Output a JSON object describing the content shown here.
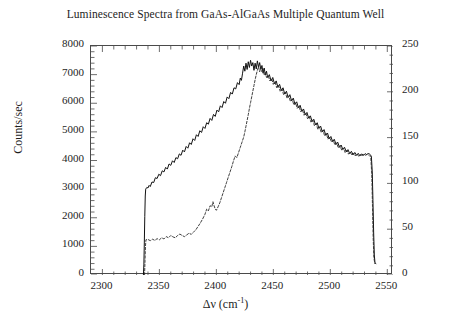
{
  "chart_data": {
    "type": "line",
    "title": "Luminescence Spectra from GaAs-AlGaAs Multiple Quantum Well",
    "xlabel_text": "Δν (cm",
    "xlabel_sup": "-1",
    "xlabel_tail": ")",
    "ylabel": "Counts/sec",
    "ylabel_right": "",
    "xlim": [
      2290,
      2555
    ],
    "ylim": [
      0,
      8000
    ],
    "ylim_right": [
      0,
      250
    ],
    "xticks": [
      2300,
      2350,
      2400,
      2450,
      2500,
      2550
    ],
    "yticks": [
      0,
      1000,
      2000,
      3000,
      4000,
      5000,
      6000,
      7000,
      8000
    ],
    "yticks_right": [
      0,
      50,
      100,
      150,
      200,
      250
    ],
    "x_minor_step": 10,
    "y_minor_step": 200,
    "y_right_minor_step": 10,
    "grid": false,
    "legend": "none",
    "series": [
      {
        "name": "solid-spectrum",
        "style": "solid",
        "color": "#111111",
        "points": [
          [
            2336.0,
            0
          ],
          [
            2336.4,
            380
          ],
          [
            2336.8,
            1150
          ],
          [
            2337.2,
            2050
          ],
          [
            2337.6,
            2760
          ],
          [
            2338.0,
            3000
          ],
          [
            2339.0,
            3060
          ],
          [
            2340.0,
            3040
          ],
          [
            2341.0,
            3130
          ],
          [
            2342.0,
            3090
          ],
          [
            2343.5,
            3250
          ],
          [
            2345.0,
            3230
          ],
          [
            2346.5,
            3400
          ],
          [
            2348.0,
            3370
          ],
          [
            2349.5,
            3520
          ],
          [
            2351.0,
            3470
          ],
          [
            2352.5,
            3640
          ],
          [
            2354.0,
            3600
          ],
          [
            2355.5,
            3760
          ],
          [
            2357.0,
            3700
          ],
          [
            2358.5,
            3880
          ],
          [
            2360.0,
            3830
          ],
          [
            2361.5,
            3990
          ],
          [
            2363.0,
            3930
          ],
          [
            2364.5,
            4100
          ],
          [
            2366.0,
            4060
          ],
          [
            2367.5,
            4230
          ],
          [
            2369.0,
            4180
          ],
          [
            2370.5,
            4360
          ],
          [
            2372.0,
            4300
          ],
          [
            2373.5,
            4490
          ],
          [
            2375.0,
            4430
          ],
          [
            2376.5,
            4620
          ],
          [
            2378.0,
            4560
          ],
          [
            2379.5,
            4760
          ],
          [
            2381.0,
            4700
          ],
          [
            2382.5,
            4900
          ],
          [
            2384.0,
            4840
          ],
          [
            2385.5,
            5040
          ],
          [
            2387.0,
            4980
          ],
          [
            2388.5,
            5180
          ],
          [
            2390.0,
            5120
          ],
          [
            2391.5,
            5320
          ],
          [
            2393.0,
            5270
          ],
          [
            2394.5,
            5470
          ],
          [
            2396.0,
            5400
          ],
          [
            2397.5,
            5610
          ],
          [
            2399.0,
            5540
          ],
          [
            2400.5,
            5760
          ],
          [
            2402.0,
            5700
          ],
          [
            2403.5,
            5910
          ],
          [
            2405.0,
            5850
          ],
          [
            2406.5,
            6060
          ],
          [
            2408.0,
            6000
          ],
          [
            2409.5,
            6220
          ],
          [
            2411.0,
            6160
          ],
          [
            2412.5,
            6380
          ],
          [
            2414.0,
            6320
          ],
          [
            2415.5,
            6540
          ],
          [
            2417.0,
            6500
          ],
          [
            2418.5,
            6720
          ],
          [
            2420.0,
            6650
          ],
          [
            2421.0,
            6880
          ],
          [
            2422.0,
            6800
          ],
          [
            2423.0,
            7050
          ],
          [
            2424.0,
            7300
          ],
          [
            2425.0,
            7120
          ],
          [
            2426.0,
            7400
          ],
          [
            2427.0,
            7180
          ],
          [
            2428.0,
            7450
          ],
          [
            2429.0,
            7250
          ],
          [
            2430.0,
            7500
          ],
          [
            2431.0,
            7300
          ],
          [
            2432.0,
            7420
          ],
          [
            2433.0,
            7150
          ],
          [
            2434.0,
            7400
          ],
          [
            2435.0,
            7200
          ],
          [
            2436.0,
            7480
          ],
          [
            2437.0,
            7260
          ],
          [
            2438.0,
            7420
          ],
          [
            2439.0,
            7180
          ],
          [
            2440.0,
            7320
          ],
          [
            2441.0,
            7050
          ],
          [
            2442.0,
            7230
          ],
          [
            2443.0,
            6980
          ],
          [
            2444.0,
            7120
          ],
          [
            2445.0,
            6900
          ],
          [
            2446.5,
            7000
          ],
          [
            2448.0,
            6780
          ],
          [
            2449.5,
            6900
          ],
          [
            2451.0,
            6680
          ],
          [
            2452.5,
            6780
          ],
          [
            2454.0,
            6560
          ],
          [
            2455.5,
            6660
          ],
          [
            2457.0,
            6440
          ],
          [
            2458.5,
            6540
          ],
          [
            2460.0,
            6320
          ],
          [
            2461.5,
            6420
          ],
          [
            2463.0,
            6200
          ],
          [
            2464.5,
            6300
          ],
          [
            2466.0,
            6080
          ],
          [
            2467.5,
            6180
          ],
          [
            2469.0,
            5960
          ],
          [
            2470.5,
            6050
          ],
          [
            2472.0,
            5840
          ],
          [
            2473.5,
            5930
          ],
          [
            2475.0,
            5720
          ],
          [
            2476.5,
            5800
          ],
          [
            2478.0,
            5600
          ],
          [
            2479.5,
            5680
          ],
          [
            2481.0,
            5480
          ],
          [
            2482.5,
            5560
          ],
          [
            2484.0,
            5360
          ],
          [
            2485.5,
            5440
          ],
          [
            2487.0,
            5240
          ],
          [
            2488.5,
            5320
          ],
          [
            2490.0,
            5120
          ],
          [
            2491.5,
            5200
          ],
          [
            2493.0,
            5000
          ],
          [
            2494.5,
            5080
          ],
          [
            2496.0,
            4880
          ],
          [
            2497.5,
            4960
          ],
          [
            2499.0,
            4760
          ],
          [
            2500.5,
            4840
          ],
          [
            2502.0,
            4660
          ],
          [
            2503.5,
            4740
          ],
          [
            2505.0,
            4560
          ],
          [
            2506.5,
            4640
          ],
          [
            2508.0,
            4460
          ],
          [
            2509.5,
            4540
          ],
          [
            2511.0,
            4380
          ],
          [
            2512.5,
            4460
          ],
          [
            2514.0,
            4300
          ],
          [
            2515.5,
            4380
          ],
          [
            2517.0,
            4240
          ],
          [
            2518.5,
            4320
          ],
          [
            2520.0,
            4200
          ],
          [
            2521.5,
            4280
          ],
          [
            2523.0,
            4180
          ],
          [
            2524.5,
            4250
          ],
          [
            2526.0,
            4160
          ],
          [
            2527.5,
            4230
          ],
          [
            2529.0,
            4180
          ],
          [
            2530.5,
            4240
          ],
          [
            2532.0,
            4200
          ],
          [
            2533.5,
            4260
          ],
          [
            2535.0,
            4200
          ],
          [
            2536.0,
            4150
          ],
          [
            2536.8,
            3600
          ],
          [
            2537.4,
            2600
          ],
          [
            2538.0,
            1500
          ],
          [
            2538.6,
            700
          ],
          [
            2539.2,
            420
          ],
          [
            2540.0,
            400
          ]
        ]
      },
      {
        "name": "dashed-spectrum",
        "style": "dashed",
        "color": "#2a2a2a",
        "points": [
          [
            2337.0,
            0
          ],
          [
            2337.4,
            500
          ],
          [
            2337.8,
            1000
          ],
          [
            2338.2,
            1230
          ],
          [
            2340.0,
            1240
          ],
          [
            2342.0,
            1200
          ],
          [
            2344.0,
            1250
          ],
          [
            2346.0,
            1210
          ],
          [
            2348.0,
            1270
          ],
          [
            2350.0,
            1230
          ],
          [
            2352.0,
            1300
          ],
          [
            2354.0,
            1260
          ],
          [
            2356.0,
            1340
          ],
          [
            2358.0,
            1300
          ],
          [
            2360.0,
            1380
          ],
          [
            2362.0,
            1330
          ],
          [
            2364.0,
            1300
          ],
          [
            2366.0,
            1380
          ],
          [
            2368.0,
            1430
          ],
          [
            2370.0,
            1380
          ],
          [
            2372.0,
            1340
          ],
          [
            2374.0,
            1400
          ],
          [
            2376.0,
            1460
          ],
          [
            2378.0,
            1420
          ],
          [
            2380.0,
            1500
          ],
          [
            2382.0,
            1580
          ],
          [
            2384.0,
            1700
          ],
          [
            2386.0,
            1820
          ],
          [
            2388.0,
            1960
          ],
          [
            2390.0,
            2120
          ],
          [
            2391.5,
            2300
          ],
          [
            2393.0,
            2240
          ],
          [
            2394.5,
            2420
          ],
          [
            2396.0,
            2380
          ],
          [
            2397.0,
            2560
          ],
          [
            2398.0,
            2420
          ],
          [
            2399.0,
            2300
          ],
          [
            2400.0,
            2260
          ],
          [
            2401.5,
            2380
          ],
          [
            2403.0,
            2520
          ],
          [
            2404.5,
            2700
          ],
          [
            2406.0,
            2880
          ],
          [
            2407.5,
            3060
          ],
          [
            2409.0,
            3240
          ],
          [
            2410.5,
            3420
          ],
          [
            2412.0,
            3600
          ],
          [
            2413.5,
            3780
          ],
          [
            2415.0,
            3980
          ],
          [
            2416.5,
            4160
          ],
          [
            2418.0,
            4100
          ],
          [
            2419.5,
            4280
          ],
          [
            2421.0,
            4460
          ],
          [
            2422.5,
            4640
          ],
          [
            2424.0,
            4820
          ],
          [
            2425.0,
            5000
          ],
          [
            2426.0,
            5200
          ],
          [
            2427.0,
            5400
          ],
          [
            2428.0,
            5600
          ],
          [
            2429.0,
            5820
          ],
          [
            2430.0,
            6020
          ],
          [
            2431.0,
            6220
          ],
          [
            2432.0,
            6420
          ],
          [
            2433.0,
            6620
          ],
          [
            2434.0,
            6820
          ],
          [
            2435.0,
            7000
          ],
          [
            2436.0,
            7150
          ],
          [
            2437.0,
            7280
          ],
          [
            2438.0,
            7100
          ],
          [
            2439.0,
            7250
          ],
          [
            2440.0,
            7100
          ],
          [
            2441.0,
            7200
          ],
          [
            2442.0,
            7000
          ],
          [
            2443.0,
            7080
          ],
          [
            2444.0,
            6900
          ],
          [
            2445.5,
            6960
          ],
          [
            2447.0,
            6780
          ],
          [
            2448.5,
            6860
          ],
          [
            2450.0,
            6660
          ],
          [
            2451.5,
            6740
          ],
          [
            2453.0,
            6540
          ],
          [
            2454.5,
            6620
          ],
          [
            2456.0,
            6420
          ],
          [
            2457.5,
            6500
          ],
          [
            2459.0,
            6300
          ],
          [
            2460.5,
            6380
          ],
          [
            2462.0,
            6180
          ],
          [
            2463.5,
            6260
          ],
          [
            2465.0,
            6060
          ],
          [
            2466.5,
            6140
          ],
          [
            2468.0,
            5940
          ],
          [
            2469.5,
            6020
          ],
          [
            2471.0,
            5820
          ],
          [
            2472.5,
            5900
          ],
          [
            2474.0,
            5700
          ],
          [
            2475.5,
            5780
          ],
          [
            2477.0,
            5580
          ],
          [
            2478.5,
            5660
          ],
          [
            2480.0,
            5460
          ],
          [
            2481.5,
            5540
          ],
          [
            2483.0,
            5340
          ],
          [
            2484.5,
            5420
          ],
          [
            2486.0,
            5220
          ],
          [
            2487.5,
            5300
          ],
          [
            2489.0,
            5100
          ],
          [
            2490.5,
            5180
          ],
          [
            2492.0,
            4980
          ],
          [
            2493.5,
            5060
          ],
          [
            2495.0,
            4860
          ],
          [
            2496.5,
            4940
          ],
          [
            2498.0,
            4740
          ],
          [
            2499.5,
            4820
          ],
          [
            2501.0,
            4640
          ],
          [
            2502.5,
            4720
          ],
          [
            2504.0,
            4540
          ],
          [
            2505.5,
            4620
          ],
          [
            2507.0,
            4440
          ],
          [
            2508.5,
            4520
          ],
          [
            2510.0,
            4360
          ],
          [
            2511.5,
            4440
          ],
          [
            2513.0,
            4280
          ],
          [
            2514.5,
            4360
          ],
          [
            2516.0,
            4220
          ],
          [
            2517.5,
            4300
          ],
          [
            2519.0,
            4180
          ],
          [
            2520.5,
            4260
          ],
          [
            2522.0,
            4160
          ],
          [
            2523.5,
            4230
          ],
          [
            2525.0,
            4140
          ],
          [
            2526.5,
            4210
          ],
          [
            2528.0,
            4150
          ],
          [
            2529.5,
            4220
          ],
          [
            2531.0,
            4170
          ],
          [
            2532.5,
            4230
          ],
          [
            2534.0,
            4180
          ],
          [
            2535.5,
            4120
          ],
          [
            2536.4,
            3500
          ],
          [
            2537.0,
            2400
          ],
          [
            2537.6,
            1300
          ],
          [
            2538.2,
            620
          ],
          [
            2539.0,
            400
          ]
        ]
      }
    ]
  }
}
